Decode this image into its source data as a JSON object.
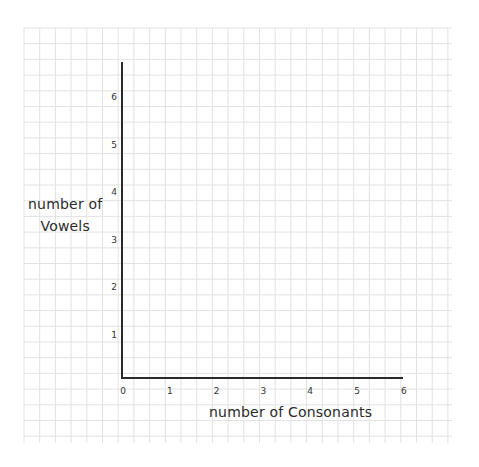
{
  "chart_data": {
    "type": "scatter",
    "title": "",
    "xlabel": "number of Consonants",
    "ylabel": "number of Vowels",
    "ylabel_lines": [
      "number of",
      "Vowels"
    ],
    "x_ticks": [
      "0",
      "1",
      "2",
      "3",
      "4",
      "5",
      "6"
    ],
    "y_ticks": [
      "1",
      "2",
      "3",
      "4",
      "5",
      "6"
    ],
    "xlim": [
      0,
      6
    ],
    "ylim": [
      0,
      6
    ],
    "grid": true,
    "series": [],
    "note": "Empty axes on graph paper; no data points plotted"
  },
  "style": {
    "grid_color": "#e2e2e2",
    "axis_color": "#2b2b2b",
    "background": "#ffffff"
  }
}
